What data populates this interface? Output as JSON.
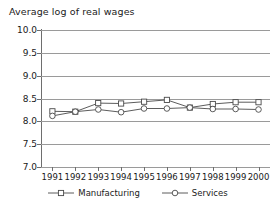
{
  "chart_data": {
    "type": "line",
    "title": "Average log of real wages",
    "xlabel": "",
    "ylabel": "",
    "x": [
      1991,
      1992,
      1993,
      1994,
      1995,
      1996,
      1997,
      1998,
      1999,
      2000
    ],
    "categories": [
      "1991",
      "1992",
      "1993",
      "1994",
      "1995",
      "1996",
      "1997",
      "1998",
      "1999",
      "2000"
    ],
    "series": [
      {
        "name": "Manufacturing",
        "marker": "square",
        "color": "#4a4a4a",
        "values": [
          8.22,
          8.21,
          8.4,
          8.39,
          8.43,
          8.47,
          8.3,
          8.38,
          8.42,
          8.42
        ]
      },
      {
        "name": "Services",
        "marker": "circle",
        "color": "#4a4a4a",
        "values": [
          8.12,
          8.21,
          8.26,
          8.2,
          8.28,
          8.28,
          8.3,
          8.27,
          8.27,
          8.26
        ]
      }
    ],
    "ylim": [
      7.0,
      10.0
    ],
    "yticks": [
      10.0,
      9.5,
      9.0,
      8.5,
      8.0,
      7.5,
      7.0
    ],
    "ytick_labels": [
      "10.0",
      "9.5",
      "9.0",
      "8.5",
      "8.0",
      "7.5",
      "7.0"
    ],
    "grid": true,
    "grid_color": "#9a9a9a",
    "axis_color": "#6e6e6e",
    "legend_position": "bottom",
    "legend": [
      "Manufacturing",
      "Services"
    ]
  }
}
